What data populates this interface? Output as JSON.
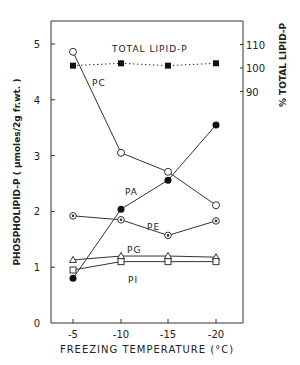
{
  "chart_data": {
    "type": "line",
    "title": "",
    "xlabel": "FREEZING TEMPERATURE (°C)",
    "ylabel": "PHOSPHOLIPID-P ( µmoles/2g fr.wt. )",
    "ylabel_right": "% TOTAL LIPID-P",
    "x": [
      -5,
      -10,
      -15,
      -20
    ],
    "x_tick_labels": [
      "-5",
      "-10",
      "-15",
      "-20"
    ],
    "ylim": [
      0,
      5.3
    ],
    "y_ticks": [
      0,
      1,
      2,
      3,
      4,
      5
    ],
    "y_right_ticks": [
      90,
      100,
      110
    ],
    "grid": false,
    "series": [
      {
        "name": "TOTAL LIPID-P",
        "axis": "right",
        "marker": "filled-square",
        "line": "dotted",
        "values": [
          101,
          102,
          101,
          102
        ]
      },
      {
        "name": "PC",
        "axis": "left",
        "marker": "open-circle",
        "line": "solid",
        "values": [
          4.86,
          3.05,
          2.71,
          2.11
        ]
      },
      {
        "name": "PA",
        "axis": "left",
        "marker": "filled-circle",
        "line": "solid",
        "values": [
          0.8,
          2.04,
          2.56,
          3.55
        ]
      },
      {
        "name": "PE",
        "axis": "left",
        "marker": "dotted-circle",
        "line": "solid",
        "values": [
          1.92,
          1.85,
          1.57,
          1.83
        ]
      },
      {
        "name": "PG",
        "axis": "left",
        "marker": "open-triangle",
        "line": "solid",
        "values": [
          1.13,
          1.2,
          1.2,
          1.18
        ]
      },
      {
        "name": "PI",
        "axis": "left",
        "marker": "open-square",
        "line": "solid",
        "values": [
          0.95,
          1.1,
          1.1,
          1.1
        ]
      }
    ]
  }
}
